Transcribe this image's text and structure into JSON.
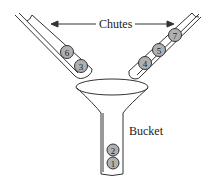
{
  "labels": {
    "chutes": "Chutes",
    "bucket": "Bucket"
  },
  "left_chute": {
    "balls": [
      "6",
      "3"
    ]
  },
  "right_chute": {
    "balls": [
      "4",
      "5",
      "7"
    ]
  },
  "bucket": {
    "balls": [
      "2",
      "1"
    ]
  },
  "colors": {
    "ball_fill": "#b0b0b0",
    "stroke": "#333333"
  }
}
